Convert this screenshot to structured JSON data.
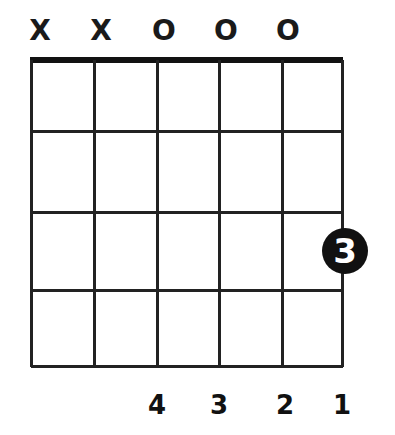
{
  "chord": {
    "string_markers": [
      "X",
      "X",
      "O",
      "O",
      "O",
      ""
    ],
    "finger_numbers_bottom": [
      "",
      "",
      "4",
      "3",
      "2",
      "1"
    ],
    "num_strings": 6,
    "num_frets": 4,
    "fingered_notes": [
      {
        "string": 6,
        "fret": 3,
        "finger": "3"
      }
    ]
  }
}
